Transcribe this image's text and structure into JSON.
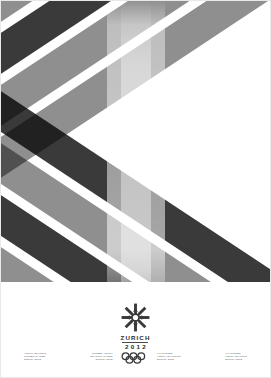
{
  "poster": {
    "title": "ZURICH 2012 Winter Youth Olympic Games Poster",
    "background_color": "#ffffff",
    "palette": {
      "dark": "#3a3a3a",
      "mid": "#8f8f8f",
      "light": "#c9c9c9",
      "white": "#ffffff",
      "text": "#555555",
      "wordmark": "#2b2b2b"
    }
  },
  "artwork": {
    "type": "diagonal-band-lattice",
    "description": "Crossing diagonal bands forming a grayscale diamond chevron lattice",
    "band_angle_deg": 33.5,
    "bands_descending": [
      {
        "offset": -42,
        "thickness": 34,
        "color": "#3a3a3a"
      },
      {
        "offset": 10,
        "thickness": 34,
        "color": "#8f8f8f"
      },
      {
        "offset": 62,
        "thickness": 34,
        "color": "#3a3a3a"
      },
      {
        "offset": 114,
        "thickness": 34,
        "color": "#8f8f8f"
      },
      {
        "offset": 166,
        "thickness": 34,
        "color": "#3a3a3a"
      },
      {
        "offset": 218,
        "thickness": 34,
        "color": "#8f8f8f"
      },
      {
        "offset": 270,
        "thickness": 34,
        "color": "#8f8f8f"
      }
    ],
    "bands_ascending": [
      {
        "offset": -42,
        "thickness": 34,
        "color": "#3a3a3a"
      },
      {
        "offset": 10,
        "thickness": 34,
        "color": "#8f8f8f"
      },
      {
        "offset": 62,
        "thickness": 34,
        "color": "#3a3a3a"
      },
      {
        "offset": 114,
        "thickness": 34,
        "color": "#8f8f8f"
      },
      {
        "offset": 166,
        "thickness": 34,
        "color": "#3a3a3a"
      },
      {
        "offset": 218,
        "thickness": 34,
        "color": "#8f8f8f"
      },
      {
        "offset": 270,
        "thickness": 34,
        "color": "#8f8f8f"
      }
    ],
    "center_glow": true
  },
  "emblem": {
    "snowflake_icon": "snowflake-icon",
    "city": "ZURICH",
    "year": "2012",
    "rings_icon": "olympic-rings-icon"
  },
  "credits": [
    {
      "id": "credit-1",
      "lines": [
        "YOUTH OLYMPIC",
        "WINTER GAMES",
        "ZURICH 2012"
      ]
    },
    {
      "id": "credit-2",
      "lines": [
        "WINTER YOUTH",
        "OLYMPIC GAMES",
        "ZURICH 2012"
      ]
    },
    {
      "id": "credit-3",
      "lines": [
        "XXI WINTER",
        "YOUTH OLYMPICS",
        "ZURICH 2012"
      ]
    },
    {
      "id": "credit-4",
      "lines": [
        "XXI WINTER",
        "YOUTH OLYMPIC",
        "ZURICH 2012"
      ]
    }
  ]
}
